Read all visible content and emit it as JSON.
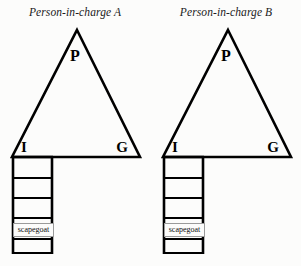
{
  "figure": {
    "type": "diagram",
    "background_color": "#fcfcfb",
    "line_color": "#000000"
  },
  "panels": [
    {
      "id": "panel-a",
      "title": "Person-in-charge A",
      "triangle": {
        "apex_label": "P",
        "bottom_left_label": "I",
        "bottom_right_label": "G"
      },
      "ladder": {
        "rung_count": 5,
        "cell_label": "scapegoat"
      }
    },
    {
      "id": "panel-b",
      "title": "Person-in-charge B",
      "triangle": {
        "apex_label": "P",
        "bottom_left_label": "I",
        "bottom_right_label": "G"
      },
      "ladder": {
        "rung_count": 5,
        "cell_label": "scapegoat"
      }
    }
  ]
}
